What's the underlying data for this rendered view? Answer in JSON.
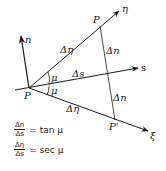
{
  "diagram": {
    "colors": {
      "line": "#1a1a1a",
      "background": "#ffffff"
    },
    "points": {
      "origin": "P",
      "upper": "P",
      "lower": "P'"
    },
    "axes": {
      "eta": "η",
      "n": "n",
      "s": "s",
      "xi": "ξ"
    },
    "segment_labels": {
      "delta_eta_upper": "Δη",
      "delta_s": "Δs",
      "delta_eta_lower": "Δη",
      "delta_n_upper": "Δn",
      "delta_n_lower": "Δn"
    },
    "angles": {
      "mu_upper": "μ",
      "mu_lower": "μ"
    },
    "formulas": [
      {
        "numerator": "Δn",
        "denominator": "Δs",
        "rhs": "= tan μ"
      },
      {
        "numerator": "Δη",
        "denominator": "Δs",
        "rhs": "= sec μ"
      }
    ]
  }
}
